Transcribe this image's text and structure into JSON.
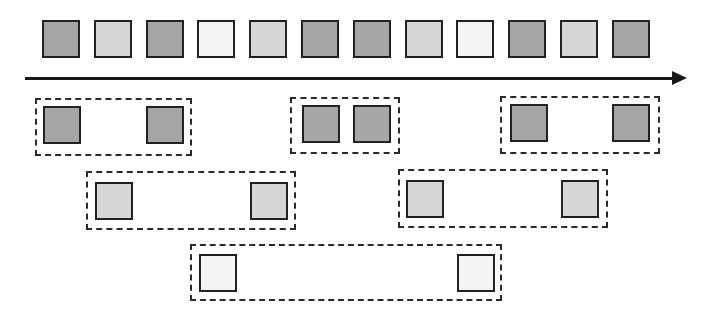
{
  "colors": {
    "dark": "#a6a6a6",
    "light": "#d6d6d6",
    "white": "#f5f5f5",
    "border": "#222222",
    "arrow": "#1a1a1a"
  },
  "sequence": {
    "items": [
      "dark",
      "light",
      "dark",
      "white",
      "light",
      "dark",
      "dark",
      "light",
      "white",
      "dark",
      "light",
      "dark"
    ],
    "x": [
      42,
      94,
      146,
      197,
      249,
      301,
      353,
      405,
      456,
      508,
      560,
      612
    ],
    "y": 20,
    "size": 38
  },
  "arrow": {
    "x1": 25,
    "x2": 687,
    "y": 78
  },
  "groups": [
    {
      "level": "dark",
      "box": [
        35,
        98,
        157,
        58
      ],
      "squares": [
        [
          43,
          106
        ],
        [
          146,
          106
        ]
      ],
      "color": "dark"
    },
    {
      "level": "dark",
      "box": [
        290,
        97,
        110,
        57
      ],
      "squares": [
        [
          302,
          105
        ],
        [
          353,
          105
        ]
      ],
      "color": "dark"
    },
    {
      "level": "dark",
      "box": [
        500,
        96,
        160,
        58
      ],
      "squares": [
        [
          510,
          104
        ],
        [
          612,
          104
        ]
      ],
      "color": "dark"
    },
    {
      "level": "light",
      "box": [
        86,
        171,
        210,
        59
      ],
      "squares": [
        [
          95,
          182
        ],
        [
          250,
          182
        ]
      ],
      "color": "light"
    },
    {
      "level": "light",
      "box": [
        398,
        169,
        210,
        59
      ],
      "squares": [
        [
          406,
          180
        ],
        [
          561,
          180
        ]
      ],
      "color": "light"
    },
    {
      "level": "white",
      "box": [
        190,
        244,
        312,
        57
      ],
      "squares": [
        [
          199,
          254
        ],
        [
          457,
          254
        ]
      ],
      "color": "white"
    }
  ]
}
